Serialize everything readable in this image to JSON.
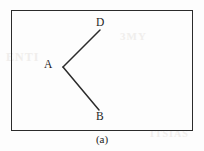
{
  "figure": {
    "caption": "(a)",
    "background_color": "#fdfdfd",
    "ink_color": "#2b2b2b",
    "frame": {
      "x": 11,
      "y": 10,
      "width": 182,
      "height": 121,
      "border_width": 1.4
    },
    "bleed_through": {
      "left_text": "ENTI",
      "middle_text": "3MY",
      "right_text": "ITSIAS"
    },
    "labels": [
      {
        "id": "D",
        "text": "D",
        "x": 96,
        "y": 17
      },
      {
        "id": "A",
        "text": "A",
        "x": 44,
        "y": 59
      },
      {
        "id": "B",
        "text": "B",
        "x": 96,
        "y": 111
      }
    ]
  },
  "chart_data": {
    "type": "scatter",
    "title": "(a)",
    "xlabel": "",
    "ylabel": "",
    "xlim": [
      0,
      204
    ],
    "ylim": [
      0,
      151
    ],
    "grid": false,
    "legend": "none",
    "points": [
      {
        "label": "A",
        "x": 63,
        "y": 67,
        "role": "vertex"
      },
      {
        "label": "D",
        "x": 100,
        "y": 30,
        "role": "endpoint"
      },
      {
        "label": "B",
        "x": 99,
        "y": 110,
        "role": "endpoint"
      }
    ],
    "segments": [
      {
        "name": "ray-AD",
        "from": "A",
        "to": "D",
        "x1": 63,
        "y1": 67,
        "x2": 100,
        "y2": 30,
        "color": "#2b2b2b",
        "width": 1.5
      },
      {
        "name": "ray-AB",
        "from": "A",
        "to": "B",
        "x1": 63,
        "y1": 67,
        "x2": 99,
        "y2": 110,
        "color": "#2b2b2b",
        "width": 1.5
      }
    ],
    "annotations": [
      "D",
      "A",
      "B",
      "(a)"
    ]
  }
}
